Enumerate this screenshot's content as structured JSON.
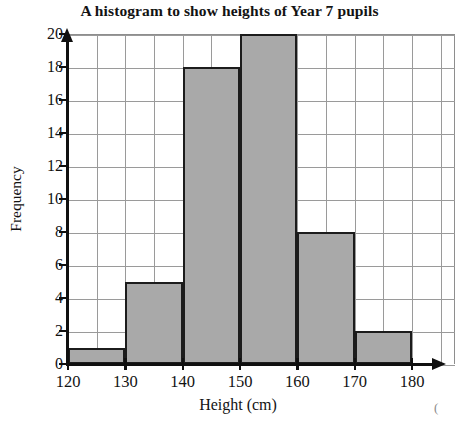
{
  "chart_data": {
    "type": "bar",
    "title": "A histogram to show heights of Year 7 pupils",
    "xlabel": "Height (cm)",
    "ylabel": "Frequency",
    "bin_edges": [
      120,
      130,
      140,
      150,
      160,
      170,
      180
    ],
    "categories": [
      "120-130",
      "130-140",
      "140-150",
      "150-160",
      "160-170",
      "170-180"
    ],
    "values": [
      1,
      5,
      18,
      20,
      8,
      2
    ],
    "xlim": [
      120,
      180
    ],
    "ylim": [
      0,
      20
    ],
    "xticks": [
      "120",
      "130",
      "140",
      "150",
      "160",
      "170",
      "180"
    ],
    "xtick_values": [
      120,
      130,
      140,
      150,
      160,
      170,
      180
    ],
    "yticks": [
      "0",
      "2",
      "4",
      "6",
      "8",
      "10",
      "12",
      "14",
      "16",
      "18",
      "20"
    ],
    "ytick_values": [
      0,
      2,
      4,
      6,
      8,
      10,
      12,
      14,
      16,
      18,
      20
    ],
    "grid": true,
    "grid_spacing_x": 5,
    "grid_spacing_y": 2,
    "legend": null,
    "bar_fill_color": "#a9a9a9",
    "bar_edge_color": "#1c1c1c",
    "grid_color": "#9a9a9a",
    "axis_color": "#101010"
  },
  "annotations": {
    "stray_mark": "("
  }
}
